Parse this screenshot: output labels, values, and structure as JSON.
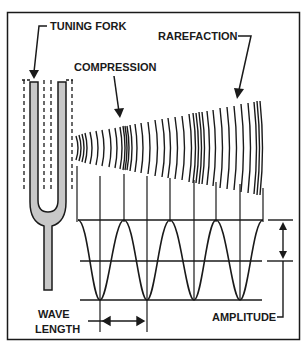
{
  "labels": {
    "tuning_fork": "TUNING FORK",
    "compression": "COMPRESSION",
    "rarefaction": "RAREFACTION",
    "wave_line1": "WAVE",
    "wave_line2": "LENGTH",
    "amplitude": "AMPLITUDE"
  },
  "colors": {
    "ink": "#1a1a1a",
    "fork_fill": "#c8c8c8",
    "background": "#ffffff"
  },
  "wave": {
    "cycles": 4,
    "top_y": 220,
    "mid_y": 261,
    "bottom_y": 300
  }
}
